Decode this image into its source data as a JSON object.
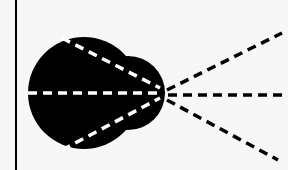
{
  "diagram": {
    "title": "",
    "colors": {
      "background": "#f7f7f7",
      "fill": "#000000",
      "inner_dash": "#ffffff",
      "outer_dash": "#000000"
    },
    "vertical_line": {
      "x": 16,
      "y1": 0,
      "y2": 170
    },
    "blob": {
      "main_circle": {
        "cx": 84,
        "cy": 93,
        "r": 56
      },
      "secondary_circle": {
        "cx": 128,
        "cy": 93,
        "r": 37
      }
    },
    "focal_point": {
      "x": 163,
      "y": 93
    },
    "inner_rays": [
      {
        "x1": 62,
        "y1": 38,
        "x2": 160,
        "y2": 88
      },
      {
        "x1": 28,
        "y1": 93,
        "x2": 160,
        "y2": 93
      },
      {
        "x1": 62,
        "y1": 150,
        "x2": 160,
        "y2": 98
      }
    ],
    "outer_rays": [
      {
        "x1": 167,
        "y1": 90,
        "x2": 282,
        "y2": 33
      },
      {
        "x1": 168,
        "y1": 95,
        "x2": 288,
        "y2": 95
      },
      {
        "x1": 167,
        "y1": 100,
        "x2": 278,
        "y2": 160
      }
    ]
  }
}
